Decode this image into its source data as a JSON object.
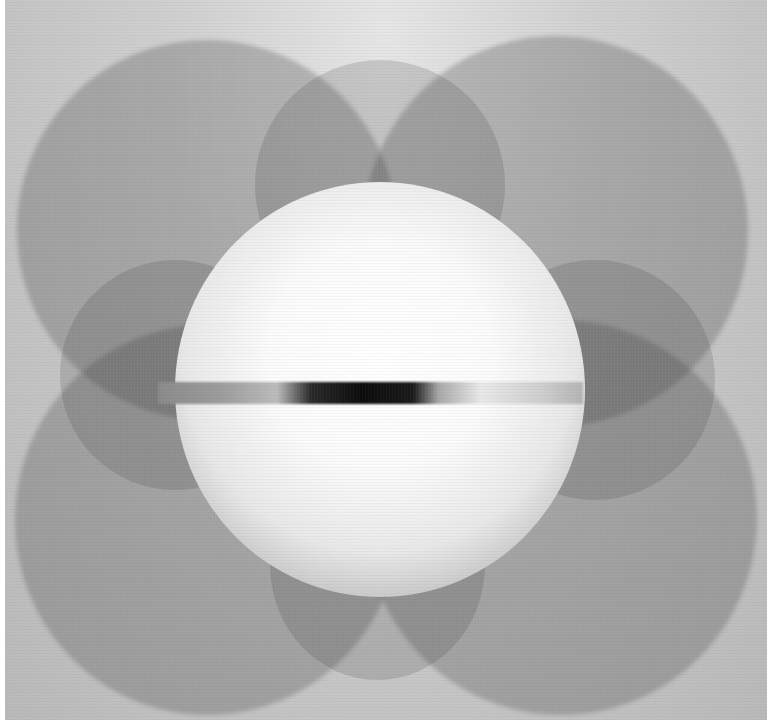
{
  "image": {
    "description": "Monochrome abstract photograph: four large overlapping circles forming a quatrefoil with a bright central sphere crossed by a horizontal dark gradient bar",
    "palette": {
      "background": "#c8c8c8",
      "circle_shade": "#8f8f8f",
      "sphere_highlight": "#ffffff",
      "bar_dark": "#0b0b0b",
      "bar_light": "#b4b4b4"
    },
    "shapes": [
      {
        "name": "circle-top-left",
        "cx": 200,
        "cy": 230,
        "r": 185
      },
      {
        "name": "circle-top-right",
        "cx": 555,
        "cy": 230,
        "r": 190
      },
      {
        "name": "circle-bottom-left",
        "cx": 200,
        "cy": 520,
        "r": 190
      },
      {
        "name": "circle-bottom-right",
        "cx": 560,
        "cy": 520,
        "r": 195
      },
      {
        "name": "central-sphere",
        "cx": 380,
        "cy": 390,
        "r": 205
      },
      {
        "name": "horizontal-bar",
        "x": 158,
        "y": 382,
        "width": 420,
        "height": 22
      }
    ]
  }
}
